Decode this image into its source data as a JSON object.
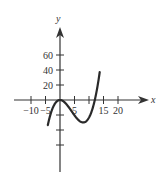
{
  "chart_data": {
    "type": "line",
    "title": "",
    "xlabel": "x",
    "ylabel": "y",
    "x_ticks": [
      -10,
      -5,
      5,
      10,
      15,
      20
    ],
    "x_tick_labels": [
      "−10",
      "−5",
      "5",
      "",
      "15",
      "20"
    ],
    "y_ticks": [
      20,
      40,
      60,
      -20,
      -40,
      -60
    ],
    "y_tick_labels": [
      "20",
      "40",
      "60",
      "",
      "",
      ""
    ],
    "xlim": [
      -10,
      25
    ],
    "ylim": [
      -80,
      80
    ],
    "grid": false,
    "legend": null,
    "series": [
      {
        "name": "cubic",
        "description": "Cubic curve with local maximum at origin (0,0), local minimum near (8,-60), crossing x-axis near x=12",
        "x": [
          -4,
          -3,
          -2,
          -1,
          0,
          1,
          2,
          3,
          4,
          5,
          6,
          7,
          8,
          9,
          10,
          11,
          12,
          13,
          14
        ],
        "y": [
          -59,
          -31,
          -13,
          -3,
          0,
          -3,
          -9,
          -19,
          -29,
          -41,
          -50,
          -56,
          -59,
          -56,
          -46,
          -28,
          0,
          39,
          90
        ]
      }
    ],
    "colors": {
      "curve": "#2a2a2a",
      "axes": "#333333"
    }
  }
}
